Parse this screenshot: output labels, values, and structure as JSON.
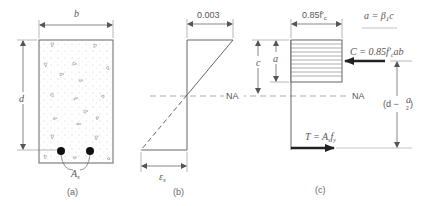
{
  "figure": {
    "panel_a": {
      "caption": "(a)",
      "width_label": "b",
      "depth_label": "d",
      "steel_label": "A",
      "steel_sub": "s"
    },
    "panel_b": {
      "caption": "(b)",
      "top_strain_label": "0.003",
      "steel_strain_label": "ε",
      "steel_strain_sub": "s",
      "neutral_axis_label": "NA"
    },
    "panel_c": {
      "caption": "(c)",
      "stress_label": "0.85f′",
      "stress_sub": "c",
      "a_equation": "a = β",
      "a_equation_sub": "1",
      "a_equation_tail": "c",
      "c_label": "c",
      "a_label": "a",
      "compression_label": "C = 0.85f′",
      "compression_sub": "c",
      "compression_tail": "ab",
      "neutral_axis_label": "NA",
      "lever_arm_label": "(d − ",
      "lever_arm_frac_num": "a",
      "lever_arm_frac_den": "2",
      "lever_arm_close": ")",
      "tension_label": "T = A",
      "tension_sub": "s",
      "tension_mid": "f",
      "tension_sub2": "y"
    }
  }
}
